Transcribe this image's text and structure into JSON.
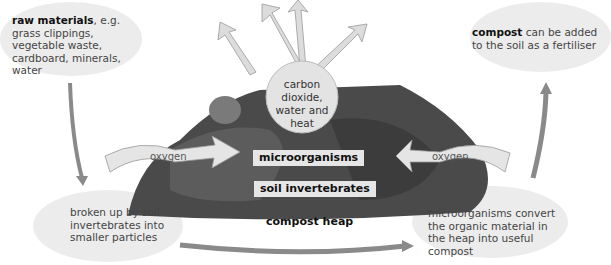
{
  "diagram": {
    "title": "compost heap",
    "raw_materials": {
      "bold": "raw materials",
      "rest": ", e.g. grass clippings, vegetable waste, cardboard, minerals, water"
    },
    "compost_use": {
      "bold": "compost",
      "rest": " can be added to the soil as a fertiliser"
    },
    "broken_up": "broken up by soil invertebrates into smaller particles",
    "convert": "microorganisms convert the organic material in the heap into useful compost",
    "products": "carbon dioxide, water and heat",
    "oxygen_left": "oxygen",
    "oxygen_right": "oxygen",
    "microorganisms": "microorganisms",
    "soil_invertebrates": "soil invertebrates"
  },
  "colors": {
    "bubble": "#ececec",
    "arrow": "#8a8a8a",
    "heap": "#4a4a4a"
  }
}
